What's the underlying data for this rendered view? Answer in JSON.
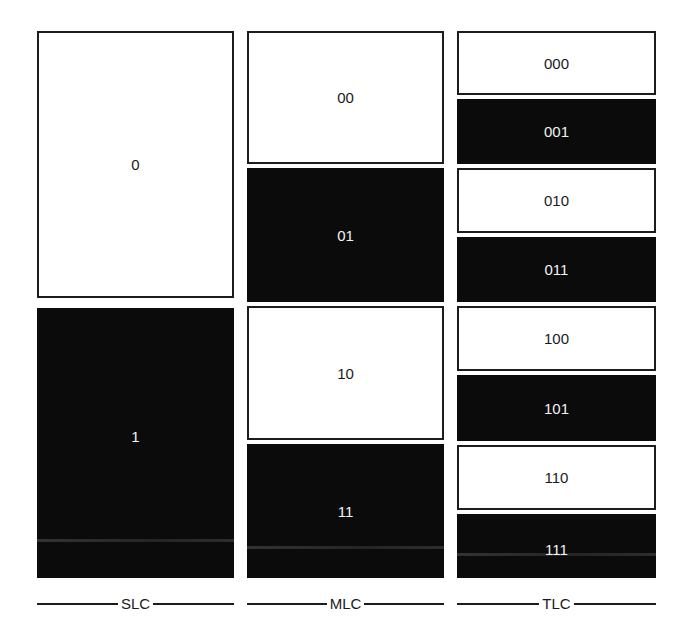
{
  "diagram": {
    "columns": [
      {
        "label": "SLC",
        "cells": [
          {
            "value": "0",
            "fill": "white"
          },
          {
            "value": "1",
            "fill": "black"
          }
        ]
      },
      {
        "label": "MLC",
        "cells": [
          {
            "value": "00",
            "fill": "white"
          },
          {
            "value": "01",
            "fill": "black"
          },
          {
            "value": "10",
            "fill": "white"
          },
          {
            "value": "11",
            "fill": "black"
          }
        ]
      },
      {
        "label": "TLC",
        "cells": [
          {
            "value": "000",
            "fill": "white"
          },
          {
            "value": "001",
            "fill": "black"
          },
          {
            "value": "010",
            "fill": "white"
          },
          {
            "value": "011",
            "fill": "black"
          },
          {
            "value": "100",
            "fill": "white"
          },
          {
            "value": "101",
            "fill": "black"
          },
          {
            "value": "110",
            "fill": "white"
          },
          {
            "value": "111",
            "fill": "black"
          }
        ]
      }
    ],
    "colors": {
      "dark": "#0b0b0b",
      "light": "#ffffff",
      "border": "#1c1c1c"
    }
  }
}
